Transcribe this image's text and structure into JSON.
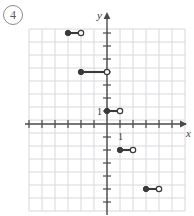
{
  "problem": {
    "number_label": "4"
  },
  "graph": {
    "axis_labels": {
      "x": "x",
      "y": "y"
    },
    "tick_labels": {
      "x_one": "1",
      "y_one": "1"
    },
    "colors": {
      "grid": "#d8d8dc",
      "axis": "#4a4a4a",
      "point_fill": "#3a3a3a",
      "point_open": "#ffffff",
      "segment": "#3a3a3a",
      "label": "#5a5a5a"
    },
    "geometry": {
      "cell_px": 13,
      "origin_x_px": 107,
      "origin_y_px": 124,
      "grid_left_px": 29,
      "grid_right_px": 185,
      "grid_top_px": 29,
      "grid_bottom_px": 211,
      "x_min": -6,
      "x_max": 6,
      "y_min": -7,
      "y_max": 7
    }
  },
  "chart_data": {
    "type": "line",
    "title": "",
    "xlabel": "x",
    "ylabel": "y",
    "xlim": [
      -6,
      6
    ],
    "ylim": [
      -7,
      7
    ],
    "grid": true,
    "legend": null,
    "series": [
      {
        "name": "step-function",
        "kind": "step-segments",
        "segments": [
          {
            "x_start": -3,
            "x_end": -2,
            "y": 7,
            "left_endpoint": "closed",
            "right_endpoint": "open"
          },
          {
            "x_start": -2,
            "x_end": 0,
            "y": 4,
            "left_endpoint": "closed",
            "right_endpoint": "open"
          },
          {
            "x_start": 0,
            "x_end": 1,
            "y": 1,
            "left_endpoint": "closed",
            "right_endpoint": "open"
          },
          {
            "x_start": 1,
            "x_end": 2,
            "y": -2,
            "left_endpoint": "closed",
            "right_endpoint": "open"
          },
          {
            "x_start": 3,
            "x_end": 4,
            "y": -5,
            "left_endpoint": "closed",
            "right_endpoint": "open"
          }
        ]
      }
    ]
  }
}
